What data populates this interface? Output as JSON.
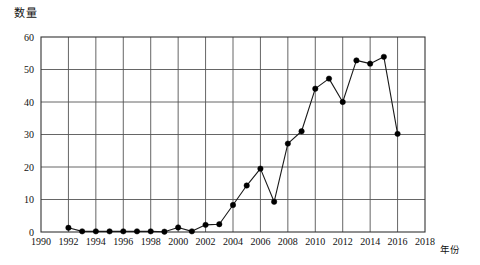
{
  "figure": {
    "ylabel": "数量",
    "xlabel": "年份",
    "background_color": "#ffffff",
    "line_color": "#1a1a1a",
    "grid_color": "#555555",
    "marker_color": "#000000"
  },
  "axes": {
    "y_ticks": [
      "0",
      "10",
      "20",
      "30",
      "40",
      "50",
      "60"
    ],
    "x_ticks": [
      "1990",
      "1992",
      "1994",
      "1996",
      "1998",
      "2000",
      "2002",
      "2004",
      "2006",
      "2008",
      "2010",
      "2012",
      "2014",
      "2016",
      "2018"
    ]
  },
  "chart_data": {
    "type": "line",
    "title": "",
    "xlabel": "年份",
    "ylabel": "数量",
    "xlim": [
      1990,
      2018
    ],
    "ylim": [
      0,
      60
    ],
    "grid": true,
    "legend": false,
    "markers": "filled-circle",
    "x": [
      1992,
      1993,
      1994,
      1995,
      1996,
      1997,
      1998,
      1999,
      2000,
      2001,
      2002,
      2003,
      2004,
      2005,
      2006,
      2007,
      2008,
      2009,
      2010,
      2011,
      2012,
      2013,
      2014,
      2015,
      2016
    ],
    "values": [
      1.3,
      0.2,
      0.2,
      0.2,
      0.2,
      0.2,
      0.2,
      0.1,
      1.4,
      0.2,
      2.2,
      2.4,
      8.3,
      14.3,
      19.5,
      9.3,
      27.2,
      31.0,
      44.1,
      47.2,
      40.0,
      52.8,
      51.8,
      53.9,
      30.2
    ],
    "x_tick_values": [
      1990,
      1992,
      1994,
      1996,
      1998,
      2000,
      2002,
      2004,
      2006,
      2008,
      2010,
      2012,
      2014,
      2016,
      2018
    ],
    "y_tick_values": [
      0,
      10,
      20,
      30,
      40,
      50,
      60
    ]
  }
}
